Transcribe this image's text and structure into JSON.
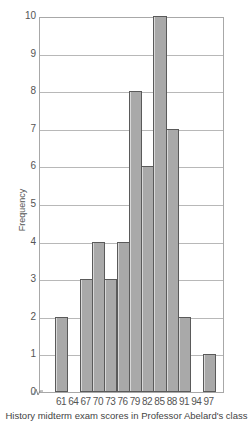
{
  "chart_data": {
    "type": "bar",
    "title": "",
    "xlabel": "History midterm exam scores in Professor Abelard's class",
    "ylabel": "Frequency",
    "ylim": [
      0,
      10
    ],
    "yticks": [
      "0",
      "1",
      "2",
      "3",
      "4",
      "5",
      "6",
      "7",
      "8",
      "9",
      "10"
    ],
    "grid": true,
    "axis_break": true,
    "categories": [
      "61",
      "64",
      "67",
      "70",
      "73",
      "76",
      "79",
      "82",
      "85",
      "88",
      "91",
      "94",
      "97"
    ],
    "values": [
      2,
      0,
      3,
      4,
      3,
      4,
      8,
      6,
      10,
      7,
      2,
      0,
      1
    ],
    "bar_color": "#a9a9a9",
    "bar_edge_color": "#5a5a5a",
    "grid_color": "#b8b8b8"
  }
}
